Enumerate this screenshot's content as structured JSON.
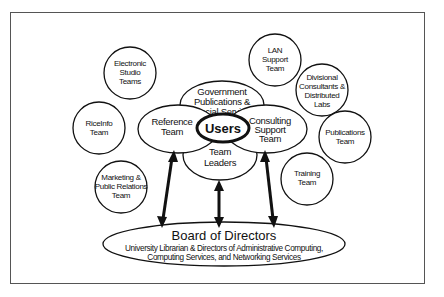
{
  "diagram": {
    "center": {
      "label": "Users"
    },
    "inner_ring": [
      {
        "id": "government",
        "lines": [
          "Government",
          "Publications &",
          "Special Services"
        ]
      },
      {
        "id": "reference",
        "lines": [
          "Reference",
          "Team"
        ]
      },
      {
        "id": "consulting",
        "lines": [
          "Consulting",
          "Support",
          "Team"
        ]
      },
      {
        "id": "team-leaders",
        "lines": [
          "Team",
          "Leaders"
        ]
      }
    ],
    "outer_teams": [
      {
        "id": "electronic-studio",
        "lines": [
          "Electronic",
          "Studio",
          "Teams"
        ]
      },
      {
        "id": "riceinfo",
        "lines": [
          "RiceInfo",
          "Team"
        ]
      },
      {
        "id": "marketing",
        "lines": [
          "Marketing &",
          "Public Relations",
          "Team"
        ]
      },
      {
        "id": "lan-support",
        "lines": [
          "LAN",
          "Support",
          "Team"
        ]
      },
      {
        "id": "divisional",
        "lines": [
          "Divisional",
          "Consultants &",
          "Distributed",
          "Labs"
        ]
      },
      {
        "id": "publications",
        "lines": [
          "Publications",
          "Team"
        ]
      },
      {
        "id": "training",
        "lines": [
          "Training",
          "Team"
        ]
      }
    ],
    "board": {
      "title": "Board of Directors",
      "subtitle_lines": [
        "University Librarian & Directors of Administrative Computing,",
        "Computing Services, and Networking Services"
      ]
    },
    "arrows": [
      {
        "from": "reference",
        "to": "board",
        "type": "bidirectional"
      },
      {
        "from": "team-leaders",
        "to": "board",
        "type": "bidirectional"
      },
      {
        "from": "consulting",
        "to": "board",
        "type": "bidirectional"
      }
    ],
    "colors": {
      "stroke": "#111111",
      "fill": "#ffffff",
      "frame": "#555555"
    }
  }
}
